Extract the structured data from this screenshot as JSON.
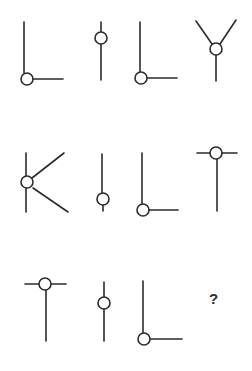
{
  "puzzle": {
    "type": "figure-sequence-matrix",
    "rows": 3,
    "cols": 4,
    "stroke_color": "#2b2b2b",
    "background": "#ffffff",
    "cells": [
      {
        "row": 1,
        "col": 1,
        "shape": "L-shape with node at corner"
      },
      {
        "row": 1,
        "col": 2,
        "shape": "vertical line with node near top"
      },
      {
        "row": 1,
        "col": 3,
        "shape": "L-shape with node at corner"
      },
      {
        "row": 1,
        "col": 4,
        "shape": "Y-shape with node at junction"
      },
      {
        "row": 2,
        "col": 1,
        "shape": "K-shape with node at junction"
      },
      {
        "row": 2,
        "col": 2,
        "shape": "vertical line with node near bottom"
      },
      {
        "row": 2,
        "col": 3,
        "shape": "L-shape with node at corner"
      },
      {
        "row": 2,
        "col": 4,
        "shape": "T-shape with node at junction"
      },
      {
        "row": 3,
        "col": 1,
        "shape": "T-shape with node at junction"
      },
      {
        "row": 3,
        "col": 2,
        "shape": "vertical line with node in middle"
      },
      {
        "row": 3,
        "col": 3,
        "shape": "L-shape with node at corner"
      },
      {
        "row": 3,
        "col": 4,
        "shape": "unknown",
        "label": "?"
      }
    ],
    "question_mark": "?"
  }
}
